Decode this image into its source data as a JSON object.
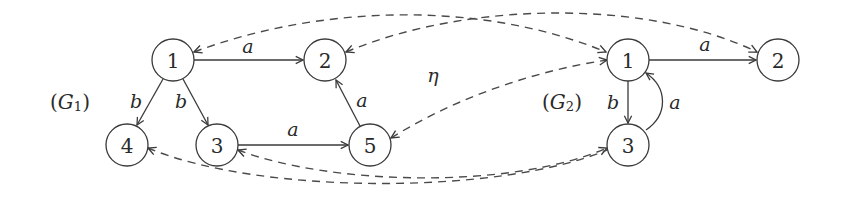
{
  "diagram": {
    "graphs": [
      {
        "id": "G1",
        "label": "(G₁)",
        "label_parts": {
          "open": "(",
          "name": "G",
          "sub": "1",
          "close": ")"
        },
        "nodes": [
          {
            "id": "1",
            "label": "1"
          },
          {
            "id": "2",
            "label": "2"
          },
          {
            "id": "3",
            "label": "3"
          },
          {
            "id": "4",
            "label": "4"
          },
          {
            "id": "5",
            "label": "5"
          }
        ],
        "edges": [
          {
            "from": "1",
            "to": "2",
            "label": "a"
          },
          {
            "from": "1",
            "to": "4",
            "label": "b"
          },
          {
            "from": "1",
            "to": "3",
            "label": "b"
          },
          {
            "from": "3",
            "to": "5",
            "label": "a"
          },
          {
            "from": "5",
            "to": "2",
            "label": "a"
          }
        ]
      },
      {
        "id": "G2",
        "label": "(G₂)",
        "label_parts": {
          "open": "(",
          "name": "G",
          "sub": "2",
          "close": ")"
        },
        "nodes": [
          {
            "id": "1",
            "label": "1"
          },
          {
            "id": "2",
            "label": "2"
          },
          {
            "id": "3",
            "label": "3"
          }
        ],
        "edges": [
          {
            "from": "1",
            "to": "2",
            "label": "a"
          },
          {
            "from": "1",
            "to": "3",
            "label": "b"
          },
          {
            "from": "3",
            "to": "1",
            "label": "a"
          }
        ]
      }
    ],
    "morphism": {
      "label": "η",
      "style": "dashed",
      "mappings": [
        {
          "from": "G1.1",
          "to": "G2.1"
        },
        {
          "from": "G1.2",
          "to": "G2.2"
        },
        {
          "from": "G1.5",
          "to": "G2.1"
        },
        {
          "from": "G1.3",
          "to": "G2.3"
        },
        {
          "from": "G1.4",
          "to": "G2.3"
        }
      ]
    },
    "colors": {
      "stroke": "#3a3a3a",
      "background": "#ffffff"
    }
  }
}
